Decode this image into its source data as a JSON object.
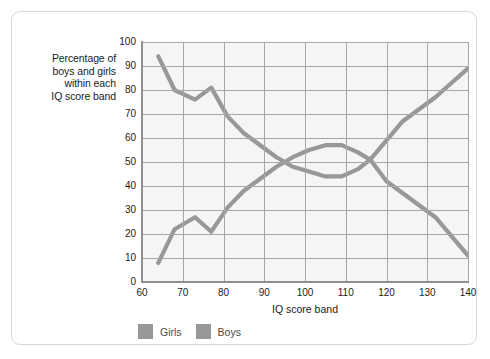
{
  "axis": {
    "y_title_lines": [
      "Percentage of",
      "boys and girls",
      "within each",
      "IQ score band"
    ],
    "x_title": "IQ score band",
    "y_ticks": [
      0,
      10,
      20,
      30,
      40,
      50,
      60,
      70,
      80,
      90,
      100
    ],
    "x_ticks": [
      60,
      70,
      80,
      90,
      100,
      110,
      120,
      130,
      140
    ]
  },
  "legend": {
    "items": [
      {
        "label": "Girls",
        "color": "#989898"
      },
      {
        "label": "Boys",
        "color": "#989898"
      }
    ]
  },
  "colors": {
    "girls_line": "#989898",
    "boys_line": "#989898",
    "grid": "#a7a7a7",
    "plot_background": "#f5f5f5",
    "frame_border": "#d8d8d8",
    "axis": "#8f8f8f",
    "text": "#1b1b1b"
  },
  "chart_data": {
    "type": "line",
    "title": "",
    "subtitle": "",
    "xlabel": "IQ score band",
    "ylabel": "Percentage of boys and girls within each IQ score band",
    "xlim": [
      60,
      140
    ],
    "ylim": [
      0,
      100
    ],
    "xticks": [
      60,
      70,
      80,
      90,
      100,
      110,
      120,
      130,
      140
    ],
    "yticks": [
      0,
      10,
      20,
      30,
      40,
      50,
      60,
      70,
      80,
      90,
      100
    ],
    "grid": true,
    "legend_position": "bottom-left",
    "x": [
      64,
      68,
      73,
      77,
      81,
      85,
      89,
      93,
      97,
      101,
      105,
      109,
      113,
      116,
      120,
      124,
      128,
      132,
      136,
      140
    ],
    "series": [
      {
        "name": "Girls",
        "color": "#989898",
        "values": [
          8,
          22,
          27,
          21,
          31,
          38,
          43,
          48,
          52,
          55,
          57,
          57,
          54,
          51,
          59,
          67,
          72,
          77,
          83,
          89
        ]
      },
      {
        "name": "Boys",
        "color": "#989898",
        "values": [
          94,
          80,
          76,
          81,
          69,
          62,
          57,
          52,
          48,
          46,
          44,
          44,
          47,
          51,
          42,
          37,
          32,
          27,
          19,
          11
        ]
      }
    ],
    "annotations": []
  }
}
